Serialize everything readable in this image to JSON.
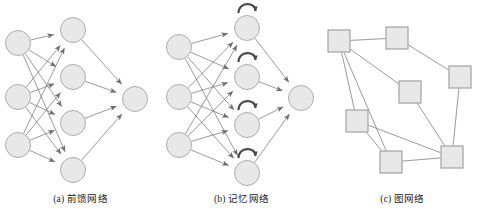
{
  "figure": {
    "background_color": "#ffffff",
    "panel_count": 3
  },
  "style": {
    "node_fill": "#e8e8e8",
    "node_stroke": "#9a9a9a",
    "edge_color": "#6e6e78",
    "loop_color": "#4a4a4a",
    "caption_color": "#1a1a1a"
  },
  "panels": [
    {
      "id": "a",
      "caption": "(a) 前馈网络",
      "type": "feedforward-network",
      "node_shape": "circle",
      "node_radius": 12.5,
      "layers": [
        {
          "name": "input-layer",
          "nodes": [
            {
              "id": "a-in-1",
              "cx": 18,
              "cy": 43
            },
            {
              "id": "a-in-2",
              "cx": 18,
              "cy": 97
            },
            {
              "id": "a-in-3",
              "cx": 18,
              "cy": 145
            }
          ]
        },
        {
          "name": "hidden-layer",
          "nodes": [
            {
              "id": "a-hid-1",
              "cx": 73,
              "cy": 30
            },
            {
              "id": "a-hid-2",
              "cx": 73,
              "cy": 77
            },
            {
              "id": "a-hid-3",
              "cx": 73,
              "cy": 123
            },
            {
              "id": "a-hid-4",
              "cx": 73,
              "cy": 170
            }
          ]
        },
        {
          "name": "output-layer",
          "nodes": [
            {
              "id": "a-out-1",
              "cx": 135,
              "cy": 99
            }
          ]
        }
      ],
      "edges": [
        {
          "from": "a-in-1",
          "to": "a-hid-1",
          "arrow": true
        },
        {
          "from": "a-in-1",
          "to": "a-hid-2",
          "arrow": true
        },
        {
          "from": "a-in-1",
          "to": "a-hid-3",
          "arrow": true
        },
        {
          "from": "a-in-1",
          "to": "a-hid-4",
          "arrow": true
        },
        {
          "from": "a-in-2",
          "to": "a-hid-1",
          "arrow": true
        },
        {
          "from": "a-in-2",
          "to": "a-hid-2",
          "arrow": true
        },
        {
          "from": "a-in-2",
          "to": "a-hid-3",
          "arrow": true
        },
        {
          "from": "a-in-2",
          "to": "a-hid-4",
          "arrow": true
        },
        {
          "from": "a-in-3",
          "to": "a-hid-1",
          "arrow": true
        },
        {
          "from": "a-in-3",
          "to": "a-hid-2",
          "arrow": true
        },
        {
          "from": "a-in-3",
          "to": "a-hid-3",
          "arrow": true
        },
        {
          "from": "a-in-3",
          "to": "a-hid-4",
          "arrow": true
        },
        {
          "from": "a-hid-1",
          "to": "a-out-1",
          "arrow": true
        },
        {
          "from": "a-hid-2",
          "to": "a-out-1",
          "arrow": true
        },
        {
          "from": "a-hid-3",
          "to": "a-out-1",
          "arrow": true
        },
        {
          "from": "a-hid-4",
          "to": "a-out-1",
          "arrow": true
        }
      ],
      "self_loops": []
    },
    {
      "id": "b",
      "caption": "(b) 记忆网络",
      "type": "memory-network",
      "node_shape": "circle",
      "node_radius": 12.5,
      "layers": [
        {
          "name": "input-layer",
          "nodes": [
            {
              "id": "b-in-1",
              "cx": 18,
              "cy": 47
            },
            {
              "id": "b-in-2",
              "cx": 18,
              "cy": 97
            },
            {
              "id": "b-in-3",
              "cx": 18,
              "cy": 145
            }
          ]
        },
        {
          "name": "hidden-layer",
          "nodes": [
            {
              "id": "b-hid-1",
              "cx": 86,
              "cy": 28
            },
            {
              "id": "b-hid-2",
              "cx": 86,
              "cy": 77
            },
            {
              "id": "b-hid-3",
              "cx": 86,
              "cy": 125
            },
            {
              "id": "b-hid-4",
              "cx": 86,
              "cy": 173
            }
          ]
        },
        {
          "name": "output-layer",
          "nodes": [
            {
              "id": "b-out-1",
              "cx": 140,
              "cy": 98
            }
          ]
        }
      ],
      "edges": [
        {
          "from": "b-in-1",
          "to": "b-hid-1",
          "arrow": true
        },
        {
          "from": "b-in-1",
          "to": "b-hid-2",
          "arrow": true
        },
        {
          "from": "b-in-1",
          "to": "b-hid-3",
          "arrow": true
        },
        {
          "from": "b-in-1",
          "to": "b-hid-4",
          "arrow": true
        },
        {
          "from": "b-in-2",
          "to": "b-hid-1",
          "arrow": true
        },
        {
          "from": "b-in-2",
          "to": "b-hid-2",
          "arrow": true
        },
        {
          "from": "b-in-2",
          "to": "b-hid-3",
          "arrow": true
        },
        {
          "from": "b-in-2",
          "to": "b-hid-4",
          "arrow": true
        },
        {
          "from": "b-in-3",
          "to": "b-hid-1",
          "arrow": true
        },
        {
          "from": "b-in-3",
          "to": "b-hid-2",
          "arrow": true
        },
        {
          "from": "b-in-3",
          "to": "b-hid-3",
          "arrow": true
        },
        {
          "from": "b-in-3",
          "to": "b-hid-4",
          "arrow": true
        },
        {
          "from": "b-hid-1",
          "to": "b-out-1",
          "arrow": true
        },
        {
          "from": "b-hid-2",
          "to": "b-out-1",
          "arrow": true
        },
        {
          "from": "b-hid-3",
          "to": "b-out-1",
          "arrow": true
        },
        {
          "from": "b-hid-4",
          "to": "b-out-1",
          "arrow": true
        }
      ],
      "self_loops": [
        {
          "node": "b-hid-1"
        },
        {
          "node": "b-hid-2"
        },
        {
          "node": "b-hid-3"
        },
        {
          "node": "b-hid-4"
        }
      ]
    },
    {
      "id": "c",
      "caption": "(c) 图网络",
      "type": "graph-network",
      "node_shape": "square",
      "node_size": 22,
      "layers": [
        {
          "name": "graph-nodes",
          "nodes": [
            {
              "id": "c-n-1",
              "cx": 17,
              "cy": 41
            },
            {
              "id": "c-n-2",
              "cx": 75,
              "cy": 38
            },
            {
              "id": "c-n-3",
              "cx": 138,
              "cy": 77
            },
            {
              "id": "c-n-4",
              "cx": 88,
              "cy": 92
            },
            {
              "id": "c-n-5",
              "cx": 35,
              "cy": 121
            },
            {
              "id": "c-n-6",
              "cx": 69,
              "cy": 162
            },
            {
              "id": "c-n-7",
              "cx": 130,
              "cy": 157
            }
          ]
        }
      ],
      "edges": [
        {
          "from": "c-n-1",
          "to": "c-n-2",
          "arrow": false
        },
        {
          "from": "c-n-2",
          "to": "c-n-3",
          "arrow": false
        },
        {
          "from": "c-n-1",
          "to": "c-n-4",
          "arrow": false
        },
        {
          "from": "c-n-1",
          "to": "c-n-5",
          "arrow": false
        },
        {
          "from": "c-n-1",
          "to": "c-n-6",
          "arrow": false
        },
        {
          "from": "c-n-3",
          "to": "c-n-7",
          "arrow": false
        },
        {
          "from": "c-n-4",
          "to": "c-n-7",
          "arrow": false
        },
        {
          "from": "c-n-5",
          "to": "c-n-6",
          "arrow": false
        },
        {
          "from": "c-n-5",
          "to": "c-n-7",
          "arrow": false
        },
        {
          "from": "c-n-6",
          "to": "c-n-7",
          "arrow": false
        }
      ],
      "self_loops": []
    }
  ]
}
